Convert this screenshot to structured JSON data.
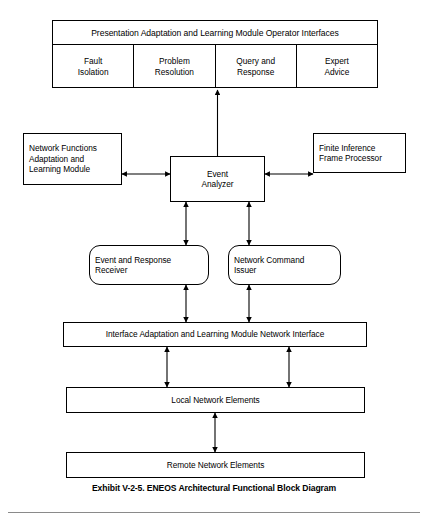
{
  "figure": {
    "caption": "Exhibit V-2-5. ENEOS Architectural Functional Block Diagram"
  },
  "operator_panel": {
    "title": "Presentation Adaptation and Learning Module Operator Interfaces",
    "cells": [
      {
        "label": "Fault\nIsolation"
      },
      {
        "label": "Problem\nResolution"
      },
      {
        "label": "Query and\nResponse"
      },
      {
        "label": "Expert\nAdvice"
      }
    ]
  },
  "nodes": {
    "network_functions": {
      "label": "Network Functions\nAdaptation and\nLearning Module"
    },
    "event_analyzer": {
      "label": "Event\nAnalyzer"
    },
    "finite_inference": {
      "label": "Finite Inference\nFrame Processor"
    },
    "event_response_receiver": {
      "label": "Event and Response\nReceiver"
    },
    "network_command_issuer": {
      "label": "Network Command\nIssuer"
    },
    "interface_adaptation": {
      "label": "Interface Adaptation and Learning Module Network Interface"
    },
    "local_network_elements": {
      "label": "Local Network Elements"
    },
    "remote_network_elements": {
      "label": "Remote Network Elements"
    }
  },
  "style": {
    "line_color": "#000000",
    "background": "#ffffff",
    "rule_color": "#8a8a8a"
  }
}
